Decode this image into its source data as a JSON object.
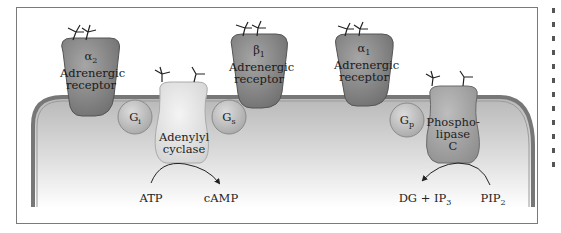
{
  "figure": {
    "type": "cell-membrane-signaling-diagram",
    "colors": {
      "frame_border": "#7a7a7a",
      "cell_fill_light": "#f2f2f2",
      "cell_fill_dark": "#bdbdbd",
      "membrane": "#7d7d7d",
      "receptor_fill": "#8c8c8c",
      "adenylyl_cyclase_fill": "#e4e4e4",
      "g_protein_fill": "#c4c4c4",
      "text": "#222222"
    },
    "receptors": [
      {
        "greek": "α",
        "subscript": "2",
        "line1": "Adrenergic",
        "line2": "receptor"
      },
      {
        "greek": "β",
        "subscript": "1",
        "line1": "Adrenergic",
        "line2": "receptor"
      },
      {
        "greek": "α",
        "subscript": "1",
        "line1": "Adrenergic",
        "line2": "receptor"
      }
    ],
    "g_proteins": [
      {
        "base": "G",
        "subscript": "i"
      },
      {
        "base": "G",
        "subscript": "s"
      },
      {
        "base": "G",
        "subscript": "p"
      }
    ],
    "effectors": {
      "adenylyl_cyclase": {
        "line1": "Adenylyl",
        "line2": "cyclase"
      },
      "phospholipase_c": {
        "line1": "Phospho-",
        "line2": "lipase",
        "line3": "C"
      }
    },
    "reactions": {
      "left": {
        "substrate": "ATP",
        "product": "cAMP"
      },
      "right": {
        "substrate_base": "PIP",
        "substrate_sub": "2",
        "product_prefix": "DG + IP",
        "product_sub": "3"
      }
    }
  }
}
